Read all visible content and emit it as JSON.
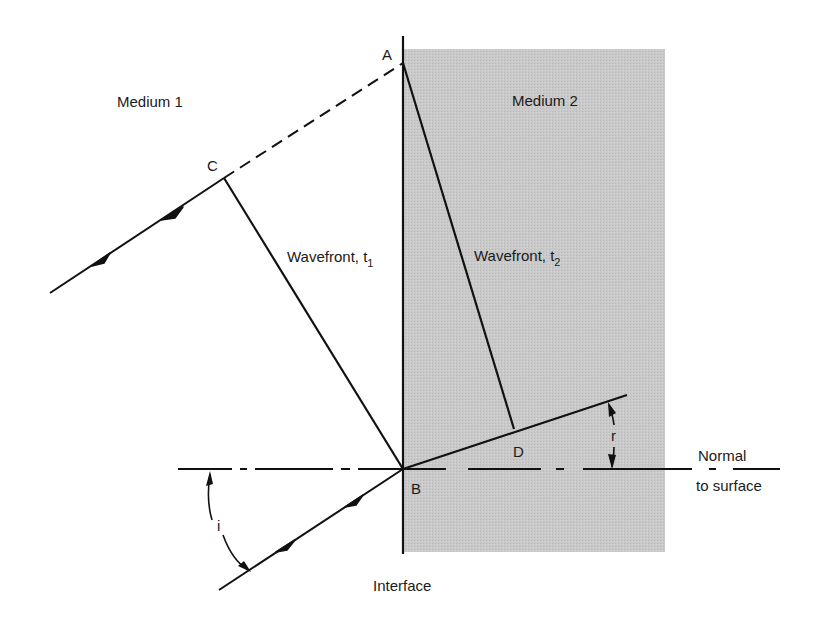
{
  "diagram": {
    "type": "refraction-wavefront",
    "colors": {
      "background": "#ffffff",
      "medium2_fill": "#c8c8c8",
      "line": "#111111",
      "text": "#1a1a1a"
    },
    "labels": {
      "medium1": "Medium 1",
      "medium2": "Medium 2",
      "point_a": "A",
      "point_b": "B",
      "point_c": "C",
      "point_d": "D",
      "wavefront1_main": "Wavefront, t",
      "wavefront1_sub": "1",
      "wavefront2_main": "Wavefront, t",
      "wavefront2_sub": "2",
      "angle_incidence": "i",
      "angle_refraction": "r",
      "normal_line1": "Normal",
      "normal_line2": "to surface",
      "interface": "Interface"
    },
    "points": {
      "A": [
        403,
        63
      ],
      "B": [
        403,
        469
      ],
      "C": [
        224,
        178
      ],
      "D": [
        514,
        429
      ]
    }
  }
}
